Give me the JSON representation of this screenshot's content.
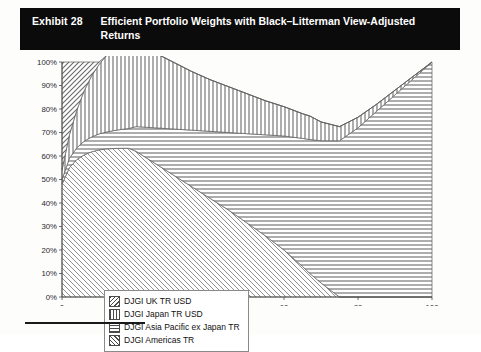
{
  "exhibit": {
    "label": "Exhibit 28",
    "title": "Efficient Portfolio Weights with Black–Litterman View-Adjusted Returns"
  },
  "legend": {
    "items": [
      {
        "label": "DJGI UK TR USD",
        "pattern": "diagonal-cross",
        "swatch_icon": "hatch-swatch-icon"
      },
      {
        "label": "DJGI Japan TR USD",
        "pattern": "vertical-lines",
        "swatch_icon": "hatch-swatch-icon"
      },
      {
        "label": "DJGI Asia Pacific ex Japan TR",
        "pattern": "horizontal-lines",
        "swatch_icon": "hatch-swatch-icon"
      },
      {
        "label": "DJGI Americas TR",
        "pattern": "forward-diagonal",
        "swatch_icon": "hatch-swatch-icon"
      }
    ]
  },
  "colors": {
    "title_bg": "#0b0b0b",
    "title_fg": "#ffffff",
    "plot_bg": "#ffffff",
    "axis": "#4a4a4a",
    "hatch": "#5a5a5a",
    "page_bg": "#fdfdfc"
  },
  "chart_data": {
    "type": "area",
    "stacked": true,
    "title": "Efficient Portfolio Weights with Black–Litterman View-Adjusted Returns",
    "xlabel": "",
    "ylabel": "",
    "xlim": [
      0,
      100
    ],
    "ylim": [
      0,
      100
    ],
    "grid": false,
    "legend_position": "inside-bottom-left",
    "xticks": [
      0,
      20,
      40,
      60,
      80,
      100
    ],
    "xticklabels": [
      "0",
      "20",
      "40",
      "60",
      "80",
      "100"
    ],
    "yticks": [
      0,
      10,
      20,
      30,
      40,
      50,
      60,
      70,
      80,
      90,
      100
    ],
    "yticklabels": [
      "0%",
      "10%",
      "20%",
      "30%",
      "40%",
      "50%",
      "60%",
      "70%",
      "80%",
      "90%",
      "100%"
    ],
    "x": [
      0,
      2,
      4,
      6,
      8,
      10,
      12,
      14,
      16,
      18,
      20,
      25,
      30,
      35,
      40,
      45,
      50,
      55,
      60,
      65,
      67,
      70,
      75,
      80,
      85,
      90,
      95,
      100
    ],
    "series": [
      {
        "name": "DJGI Americas TR",
        "pattern": "forward-diagonal",
        "values": [
          48,
          55,
          58.5,
          60.5,
          61.8,
          62.6,
          63.0,
          63.2,
          63.3,
          63.3,
          62.0,
          57.0,
          52.0,
          47.0,
          42.0,
          37.0,
          31.5,
          26.0,
          20.0,
          13.0,
          10.0,
          6.0,
          0.0,
          0.0,
          0.0,
          0.0,
          0.0,
          0.0
        ]
      },
      {
        "name": "DJGI Asia Pacific ex Japan TR",
        "pattern": "horizontal-lines",
        "values": [
          2.0,
          4.0,
          5.0,
          5.8,
          6.3,
          6.8,
          7.2,
          7.6,
          8.0,
          8.4,
          10.5,
          15.0,
          19.5,
          24.0,
          28.5,
          33.0,
          38.0,
          43.0,
          48.5,
          54.5,
          57.0,
          60.5,
          66.5,
          72.0,
          79.0,
          86.0,
          93.0,
          100.0
        ]
      },
      {
        "name": "DJGI Japan TR USD",
        "pattern": "vertical-lines",
        "values": [
          4.0,
          10.0,
          16.0,
          21.5,
          26.0,
          29.5,
          32.5,
          35.0,
          36.8,
          38.3,
          36.5,
          32.0,
          28.5,
          25.0,
          22.0,
          19.5,
          17.0,
          14.5,
          12.5,
          10.5,
          10.0,
          8.0,
          6.0,
          4.5,
          3.0,
          2.0,
          1.0,
          0.0
        ]
      },
      {
        "name": "DJGI UK TR USD",
        "pattern": "diagonal-cross",
        "values": [
          46.0,
          31.0,
          20.5,
          12.2,
          5.9,
          1.1,
          0.0,
          0.0,
          0.0,
          0.0,
          0.0,
          0.0,
          0.0,
          0.0,
          0.0,
          0.0,
          0.0,
          0.0,
          0.0,
          0.0,
          0.0,
          0.0,
          0.0,
          0.0,
          0.0,
          0.0,
          0.0,
          0.0
        ]
      }
    ]
  }
}
